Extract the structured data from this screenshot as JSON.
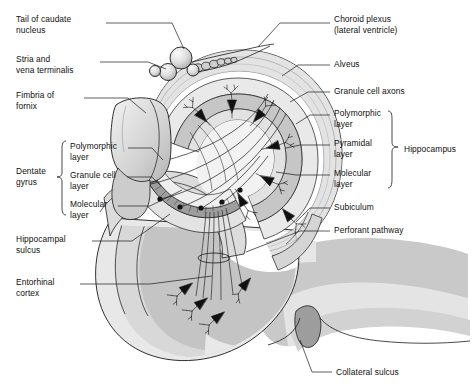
{
  "figure": {
    "type": "anatomical-diagram",
    "background_color": "#ffffff",
    "line_color": "#1a1a1a",
    "text_color": "#101010"
  },
  "palette": {
    "white": "#ffffff",
    "pale_gray": "#ededed",
    "light_gray": "#dcdcdc",
    "mid_gray": "#c9c9c9",
    "gray": "#b8b8b8",
    "dark_gray": "#9a9a9a",
    "outline": "#1a1a1a",
    "neuron_black": "#111111"
  },
  "labels_left": [
    {
      "id": "tail-of-caudate-nucleus",
      "lines": [
        "Tail of caudate",
        "nucleus"
      ],
      "x": 16,
      "y": 17
    },
    {
      "id": "stria-and-vena-terminalis",
      "lines": [
        "Stria and",
        "vena terminalis"
      ],
      "x": 16,
      "y": 57
    },
    {
      "id": "fimbria-of-fornix",
      "lines": [
        "Fimbria of",
        "fornix"
      ],
      "x": 16,
      "y": 93
    },
    {
      "id": "polymorphic-layer-dg",
      "lines": [
        "Polymorphic",
        "layer"
      ],
      "x": 70,
      "y": 143
    },
    {
      "id": "granule-cell-layer",
      "lines": [
        "Granule cell",
        "layer"
      ],
      "x": 70,
      "y": 172
    },
    {
      "id": "molecular-layer-dg",
      "lines": [
        "Molecular",
        "layer"
      ],
      "x": 70,
      "y": 201
    },
    {
      "id": "dentate-gyrus",
      "lines": [
        "Dentate",
        "gyrus"
      ],
      "x": 16,
      "y": 168
    },
    {
      "id": "hippocampal-sulcus",
      "lines": [
        "Hippocampal",
        "sulcus"
      ],
      "x": 16,
      "y": 236
    },
    {
      "id": "entorhinal-cortex",
      "lines": [
        "Entorhinal",
        "cortex"
      ],
      "x": 16,
      "y": 279
    }
  ],
  "labels_right": [
    {
      "id": "choroid-plexus",
      "lines": [
        "Choroid plexus",
        "(lateral ventricle)"
      ],
      "x": 334,
      "y": 17
    },
    {
      "id": "alveus",
      "lines": [
        "Alveus"
      ],
      "x": 334,
      "y": 61
    },
    {
      "id": "granule-cell-axons",
      "lines": [
        "Granule cell axons"
      ],
      "x": 334,
      "y": 88
    },
    {
      "id": "polymorphic-layer-hip",
      "lines": [
        "Polymorphic",
        "layer"
      ],
      "x": 334,
      "y": 110
    },
    {
      "id": "pyramidal-layer",
      "lines": [
        "Pyramidal",
        "layer"
      ],
      "x": 334,
      "y": 140
    },
    {
      "id": "molecular-layer-hip",
      "lines": [
        "Molecular",
        "layer"
      ],
      "x": 334,
      "y": 170
    },
    {
      "id": "hippocampus",
      "lines": [
        "Hippocampus"
      ],
      "x": 405,
      "y": 146
    },
    {
      "id": "subiculum",
      "lines": [
        "Subiculum"
      ],
      "x": 334,
      "y": 204
    },
    {
      "id": "perforant-pathway",
      "lines": [
        "Perforant pathway"
      ],
      "x": 334,
      "y": 227
    }
  ],
  "labels_bottom": [
    {
      "id": "collateral-sulcus",
      "lines": [
        "Collateral sulcus"
      ],
      "x": 336,
      "y": 369
    }
  ],
  "brackets": [
    {
      "id": "dentate-gyrus-bracket",
      "side": "left",
      "x": 62,
      "top": 140,
      "bottom": 215
    },
    {
      "id": "hippocampus-bracket",
      "side": "right",
      "x": 392,
      "top": 110,
      "bottom": 190
    }
  ],
  "structures": [
    "tail of caudate nucleus",
    "stria terminalis",
    "vena terminalis",
    "fimbria of fornix",
    "choroid plexus",
    "lateral ventricle",
    "alveus",
    "granule cell axons (mossy fibers)",
    "dentate gyrus polymorphic layer",
    "dentate gyrus granule cell layer",
    "dentate gyrus molecular layer",
    "hippocampus polymorphic layer",
    "hippocampus pyramidal layer",
    "hippocampus molecular layer",
    "subiculum",
    "perforant pathway",
    "hippocampal sulcus",
    "entorhinal cortex",
    "collateral sulcus"
  ]
}
